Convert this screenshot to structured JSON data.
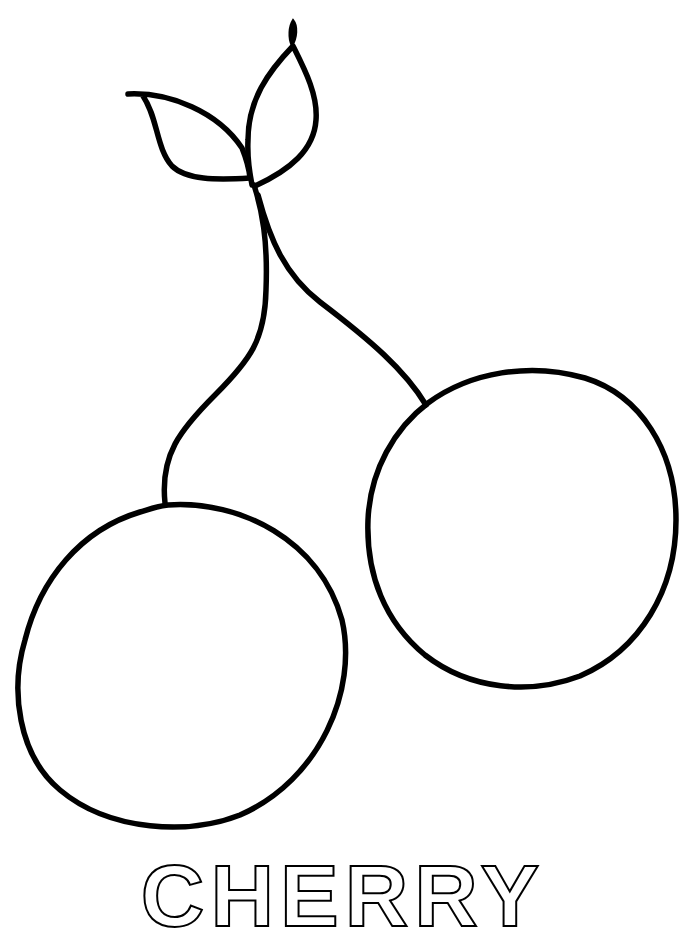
{
  "page": {
    "type": "coloring-page",
    "background_color": "#ffffff",
    "ink_color": "#000000"
  },
  "illustration": {
    "subject": "cherries",
    "elements": [
      {
        "name": "leaf-left"
      },
      {
        "name": "leaf-right"
      },
      {
        "name": "stem-tip"
      },
      {
        "name": "stem-left"
      },
      {
        "name": "stem-right"
      },
      {
        "name": "cherry-left"
      },
      {
        "name": "cherry-right"
      }
    ]
  },
  "title": {
    "text": "CHERRY",
    "style": "outlined",
    "cropped": true
  }
}
